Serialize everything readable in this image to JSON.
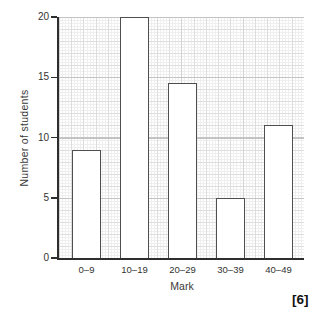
{
  "page": {
    "marks_badge": "[6]"
  },
  "chart_data": {
    "type": "bar",
    "title": "",
    "categories": [
      "0–9",
      "10–19",
      "20–29",
      "30–39",
      "40–49"
    ],
    "values": [
      9,
      20,
      14.5,
      5,
      11
    ],
    "xlabel": "Mark",
    "ylabel": "Number of students",
    "ylim": [
      0,
      20
    ],
    "yticks": [
      0,
      5,
      10,
      15,
      20
    ],
    "grid": "fine graph paper, major lines every 5 units",
    "legend": "none",
    "bar_fill": "#ffffff",
    "bar_border": "#4f4f4f",
    "axis_color": "#2e2e2e",
    "grid_major_color": "#c3c3c3",
    "grid_minor_color": "#efefef",
    "text_color": "#333333"
  }
}
